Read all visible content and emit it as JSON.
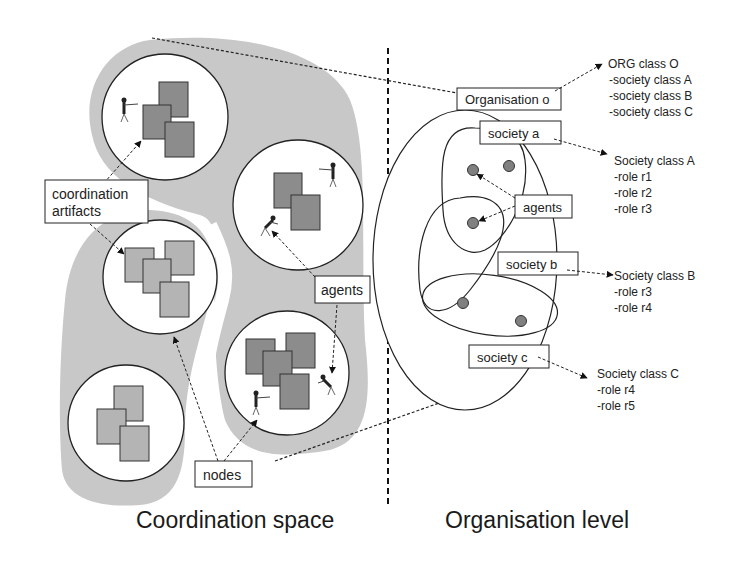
{
  "sections": {
    "left_title": "Coordination space",
    "right_title": "Organisation level"
  },
  "left": {
    "callouts": {
      "coordination_artifacts_line1": "coordination",
      "coordination_artifacts_line2": "artifacts",
      "agents": "agents",
      "nodes": "nodes"
    }
  },
  "right": {
    "boxes": {
      "organisation": "Organisation o",
      "society_a": "society a",
      "society_b": "society b",
      "society_c": "society c",
      "agents": "agents"
    },
    "org_class": {
      "title": "ORG class O",
      "items": [
        "-society class A",
        "-society class B",
        "-society class C"
      ]
    },
    "society_class_a": {
      "title": "Society class A",
      "items": [
        "-role r1",
        "-role r2",
        "-role r3"
      ]
    },
    "society_class_b": {
      "title": "Society class B",
      "items": [
        "-role r3",
        "-role r4"
      ]
    },
    "society_class_c": {
      "title": "Society class C",
      "items": [
        "-role r4",
        "-role r5"
      ]
    }
  },
  "colors": {
    "region_fill": "#c8c8c8",
    "artifact_dark": "#8c8c8c",
    "artifact_light": "#b4b4b4",
    "agent_dot": "#808080",
    "stroke": "#222222"
  }
}
